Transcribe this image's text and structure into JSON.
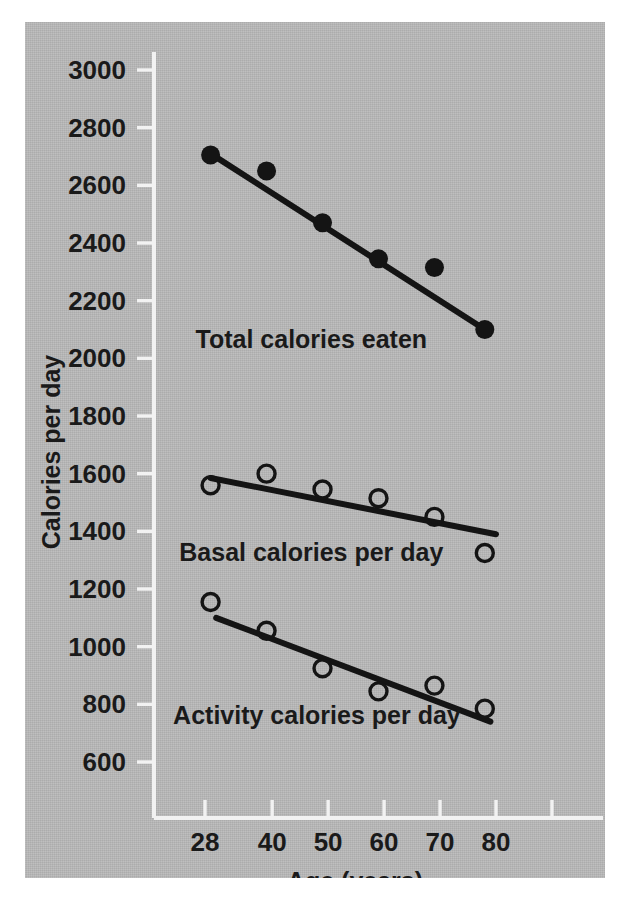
{
  "figure": {
    "background_color": "#b8b8b8",
    "ink_color": "#141414",
    "axis_color": "#f2f2f2",
    "page_color": "#ffffff"
  },
  "chart_data": {
    "type": "scatter",
    "title": "",
    "subtitle": "",
    "xlabel": "Age (years)",
    "ylabel": "Calories per day",
    "xlim": [
      20,
      100
    ],
    "ylim": [
      520,
      3080
    ],
    "grid": false,
    "legend": "inline-annotations",
    "x_ticks": [
      28,
      40,
      50,
      60,
      70,
      80,
      90,
      100
    ],
    "x_tick_labels": [
      "28",
      "40",
      "50",
      "60",
      "70",
      "80",
      "",
      ""
    ],
    "y_ticks": [
      600,
      800,
      1000,
      1200,
      1400,
      1600,
      1800,
      2000,
      2200,
      2400,
      2600,
      2800,
      3000
    ],
    "y_tick_labels": [
      "600",
      "800",
      "1000",
      "1200",
      "1400",
      "1600",
      "1800",
      "2000",
      "2200",
      "2400",
      "2600",
      "2800",
      "3000"
    ],
    "series": [
      {
        "name": "Total calories eaten",
        "marker": "filled-circle",
        "annotation": "Total calories eaten",
        "x": [
          29,
          39,
          49,
          59,
          69,
          78
        ],
        "values": [
          2705,
          2650,
          2470,
          2345,
          2315,
          2100
        ],
        "fit_line": {
          "x": [
            29,
            78
          ],
          "y": [
            2710,
            2100
          ]
        }
      },
      {
        "name": "Basal calories per day",
        "marker": "open-circle",
        "annotation": "Basal calories per day",
        "x": [
          29,
          39,
          49,
          59,
          69,
          78
        ],
        "values": [
          1560,
          1600,
          1545,
          1515,
          1450,
          1325
        ],
        "fit_line": {
          "x": [
            29,
            80
          ],
          "y": [
            1585,
            1390
          ]
        }
      },
      {
        "name": "Activity calories per day",
        "marker": "open-circle",
        "annotation": "Activity calories per day",
        "x": [
          29,
          39,
          49,
          59,
          69,
          78
        ],
        "values": [
          1155,
          1055,
          925,
          845,
          865,
          785
        ],
        "fit_line": {
          "x": [
            30,
            79
          ],
          "y": [
            1100,
            740
          ]
        }
      }
    ],
    "annotations": [
      {
        "text": "Total calories eaten",
        "x": 47,
        "y": 2065
      },
      {
        "text": "Basal calories per day",
        "x": 47,
        "y": 1325
      },
      {
        "text": "Activity calories per day",
        "x": 48,
        "y": 760
      }
    ]
  }
}
